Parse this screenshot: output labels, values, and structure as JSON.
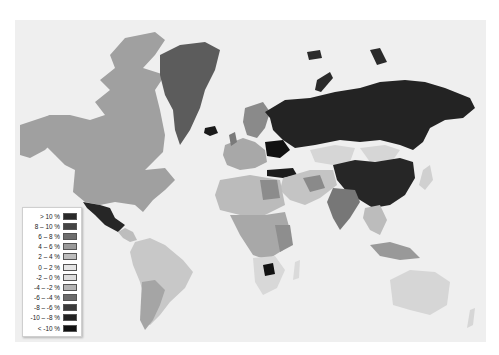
{
  "map": {
    "type": "choropleth",
    "background_color": "#efefef",
    "ocean_color": "#efefef"
  },
  "legend": {
    "items": [
      {
        "label": "> 10 %",
        "color": "#2a2a2a"
      },
      {
        "label": "8 – 10 %",
        "color": "#444444"
      },
      {
        "label": "6 – 8 %",
        "color": "#6e6e6e"
      },
      {
        "label": "4 – 6 %",
        "color": "#9a9a9a"
      },
      {
        "label": "2 – 4 %",
        "color": "#bdbdbd"
      },
      {
        "label": "0 – 2 %",
        "color": "#e4e4e4"
      },
      {
        "label": "-2 – 0 %",
        "color": "#dddddd"
      },
      {
        "label": "-4 – -2 %",
        "color": "#b4b4b4"
      },
      {
        "label": "-6 – -4 %",
        "color": "#6a6a6a"
      },
      {
        "label": "-8 – -6 %",
        "color": "#3a3a3a"
      },
      {
        "label": "-10 – -8 %",
        "color": "#222222"
      },
      {
        "label": "< -10 %",
        "color": "#111111"
      }
    ]
  },
  "regions": [
    {
      "name": "greenland",
      "color": "#5c5c5c"
    },
    {
      "name": "canada",
      "color": "#a0a0a0"
    },
    {
      "name": "alaska-usa",
      "color": "#a0a0a0"
    },
    {
      "name": "usa",
      "color": "#a0a0a0"
    },
    {
      "name": "mexico",
      "color": "#262626"
    },
    {
      "name": "central-america",
      "color": "#bdbdbd"
    },
    {
      "name": "south-america",
      "color": "#c8c8c8"
    },
    {
      "name": "argentina",
      "color": "#a5a5a5"
    },
    {
      "name": "russia",
      "color": "#232323"
    },
    {
      "name": "scandinavia",
      "color": "#8a8a8a"
    },
    {
      "name": "europe-west",
      "color": "#a8a8a8"
    },
    {
      "name": "ukraine",
      "color": "#111111"
    },
    {
      "name": "turkey",
      "color": "#1c1c1c"
    },
    {
      "name": "kazakhstan",
      "color": "#d6d6d6"
    },
    {
      "name": "mongolia",
      "color": "#d6d6d6"
    },
    {
      "name": "china",
      "color": "#262626"
    },
    {
      "name": "india",
      "color": "#777777"
    },
    {
      "name": "middle-east",
      "color": "#c4c4c4"
    },
    {
      "name": "north-africa",
      "color": "#bbbbbb"
    },
    {
      "name": "central-africa",
      "color": "#a8a8a8"
    },
    {
      "name": "southern-africa",
      "color": "#d8d8d8"
    },
    {
      "name": "botswana",
      "color": "#111111"
    },
    {
      "name": "southeast-asia",
      "color": "#bcbcbc"
    },
    {
      "name": "indonesia",
      "color": "#999999"
    },
    {
      "name": "japan",
      "color": "#d0d0d0"
    },
    {
      "name": "australia",
      "color": "#d6d6d6"
    },
    {
      "name": "new-zealand",
      "color": "#d6d6d6"
    },
    {
      "name": "iceland",
      "color": "#1a1a1a"
    },
    {
      "name": "arctic-islands",
      "color": "#2a2a2a"
    }
  ]
}
